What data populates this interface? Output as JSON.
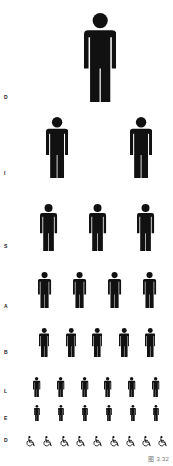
{
  "figure": {
    "caption": "图 3.32",
    "colors": {
      "ink": "#111111",
      "background": "#ffffff",
      "label": "#222222",
      "caption": "#777777"
    }
  },
  "rows": [
    {
      "label": "D",
      "icon": "person-icon",
      "count": 1,
      "label_y": 95,
      "top": 13,
      "height": 89,
      "xs": [
        100
      ]
    },
    {
      "label": "I",
      "icon": "person-icon",
      "count": 2,
      "label_y": 171,
      "top": 117,
      "height": 61,
      "xs": [
        57,
        141
      ]
    },
    {
      "label": "S",
      "icon": "person-icon",
      "count": 3,
      "label_y": 244,
      "top": 204,
      "height": 47,
      "xs": [
        49,
        98,
        146
      ]
    },
    {
      "label": "A",
      "icon": "person-icon",
      "count": 4,
      "label_y": 304,
      "top": 272,
      "height": 36,
      "xs": [
        45,
        80,
        115,
        150
      ]
    },
    {
      "label": "B",
      "icon": "person-icon",
      "count": 5,
      "label_y": 350,
      "top": 328,
      "height": 29,
      "xs": [
        44,
        71,
        97,
        124,
        150
      ]
    },
    {
      "label": "L",
      "icon": "person-icon",
      "count": 6,
      "label_y": 389,
      "top": 377,
      "height": 20,
      "xs": [
        37,
        61,
        85,
        108,
        132,
        156
      ]
    },
    {
      "label": "E",
      "icon": "person-icon",
      "count": 6,
      "label_y": 416,
      "top": 405,
      "height": 16,
      "xs": [
        37,
        61,
        85,
        109,
        133,
        156
      ]
    },
    {
      "label": "D",
      "icon": "wheelchair-icon",
      "count": 9,
      "label_y": 438,
      "top": 433,
      "height": 11,
      "xs": [
        30,
        47,
        64,
        80,
        97,
        114,
        130,
        146,
        162
      ]
    }
  ]
}
